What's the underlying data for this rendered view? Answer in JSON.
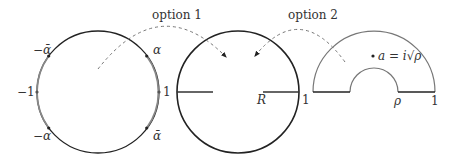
{
  "diagram": {
    "arrows": [
      {
        "label": "option 1",
        "from": "unit-circle",
        "to": "slit-disk"
      },
      {
        "label": "option 2",
        "from": "half-annulus",
        "to": "slit-disk"
      }
    ],
    "unit_circle": {
      "points": [
        {
          "label": "−ᾱ",
          "text": "−ᾱ"
        },
        {
          "label": "α"
        },
        {
          "label": "−1"
        },
        {
          "label": "1"
        },
        {
          "label": "−α"
        },
        {
          "label": "ᾱ"
        }
      ]
    },
    "slit_disk": {
      "labels": {
        "R": "R",
        "one": "1"
      }
    },
    "half_annulus": {
      "labels": {
        "rho": "ρ",
        "one": "1",
        "point": "a = i√ρ"
      }
    },
    "colors": {
      "dark": "#222222",
      "gray": "#777777",
      "dash": "#777777"
    }
  }
}
